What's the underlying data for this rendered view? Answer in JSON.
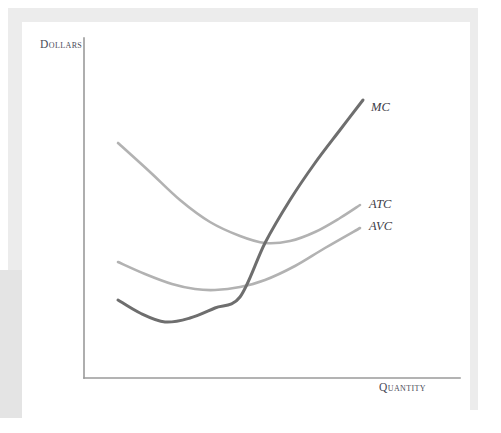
{
  "figure": {
    "kind": "economics-cost-curve-diagram",
    "background_color": "#ffffff",
    "frame_color": "#ececec",
    "panel_color": "#ffffff"
  },
  "axes": {
    "y_label": "Dollars",
    "x_label": "Quantity",
    "axis_color": "#9a9a9a",
    "origin": {
      "x": 84,
      "y": 378
    },
    "y_top": 38,
    "x_right": 460
  },
  "labels": {
    "mc": "MC",
    "atc": "ATC",
    "avc": "AVC"
  },
  "chart_data": {
    "type": "line",
    "title": "",
    "xlabel": "Quantity",
    "ylabel": "Dollars",
    "grid": false,
    "legend": "inline-end-of-curve",
    "axis_ticks": {
      "x": [],
      "y": []
    },
    "series": [
      {
        "name": "MC",
        "label": "MC",
        "color": "#6e6e6e",
        "stroke_width": 3.0,
        "description": "Marginal cost: U-shaped, starts moderately high at low quantity, falls to a minimum, then rises steeply and is the highest curve at large quantity.",
        "points": [
          {
            "x": 118,
            "y": 300
          },
          {
            "x": 140,
            "y": 313
          },
          {
            "x": 165,
            "y": 322
          },
          {
            "x": 190,
            "y": 318
          },
          {
            "x": 215,
            "y": 308
          },
          {
            "x": 240,
            "y": 297
          },
          {
            "x": 265,
            "y": 243
          },
          {
            "x": 290,
            "y": 200
          },
          {
            "x": 315,
            "y": 163
          },
          {
            "x": 340,
            "y": 130
          },
          {
            "x": 363,
            "y": 100
          }
        ],
        "intersections": [
          {
            "with": "AVC",
            "at_min_of": "AVC",
            "x": 240,
            "y": 297
          },
          {
            "with": "ATC",
            "at_min_of": "ATC",
            "x": 265,
            "y": 243
          }
        ]
      },
      {
        "name": "ATC",
        "label": "ATC",
        "color": "#b2b2b2",
        "stroke_width": 2.6,
        "description": "Average total cost: U-shaped, very high at low quantity, declines to a minimum near the middle, then rises gently.",
        "points": [
          {
            "x": 118,
            "y": 143
          },
          {
            "x": 150,
            "y": 172
          },
          {
            "x": 180,
            "y": 200
          },
          {
            "x": 210,
            "y": 222
          },
          {
            "x": 240,
            "y": 236
          },
          {
            "x": 265,
            "y": 243
          },
          {
            "x": 290,
            "y": 241
          },
          {
            "x": 315,
            "y": 232
          },
          {
            "x": 340,
            "y": 218
          },
          {
            "x": 360,
            "y": 205
          }
        ],
        "minimum": {
          "x": 265,
          "y": 243
        }
      },
      {
        "name": "AVC",
        "label": "AVC",
        "color": "#b2b2b2",
        "stroke_width": 2.6,
        "description": "Average variable cost: U-shaped and lies below ATC everywhere, with a shallower decline and a minimum at a smaller quantity than ATC.",
        "points": [
          {
            "x": 118,
            "y": 262
          },
          {
            "x": 145,
            "y": 274
          },
          {
            "x": 172,
            "y": 284
          },
          {
            "x": 195,
            "y": 289
          },
          {
            "x": 215,
            "y": 290
          },
          {
            "x": 240,
            "y": 287
          },
          {
            "x": 265,
            "y": 280
          },
          {
            "x": 295,
            "y": 266
          },
          {
            "x": 325,
            "y": 248
          },
          {
            "x": 360,
            "y": 228
          }
        ],
        "minimum": {
          "x": 215,
          "y": 290
        }
      }
    ]
  }
}
